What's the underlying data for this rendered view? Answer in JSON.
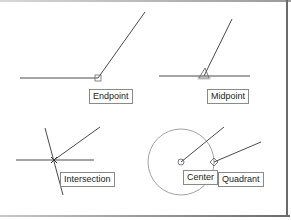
{
  "diagram": {
    "panels": [
      {
        "id": "endpoint",
        "label": "Endpoint"
      },
      {
        "id": "midpoint",
        "label": "Midpoint"
      },
      {
        "id": "intersection",
        "label": "Intersection"
      },
      {
        "id": "center",
        "label": "Center"
      },
      {
        "id": "quadrant",
        "label": "Quadrant"
      }
    ]
  },
  "colors": {
    "line": "#4a4a4a",
    "circle": "#8a8a8a",
    "label_border": "#8a8a8a",
    "frame": "#6b6b6b"
  }
}
